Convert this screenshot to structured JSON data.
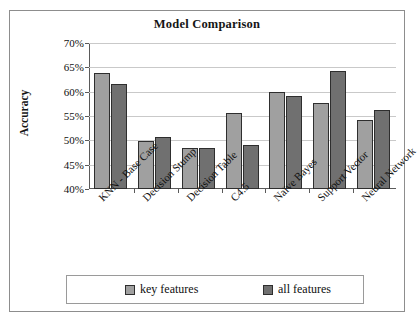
{
  "chart_data": {
    "type": "bar",
    "title": "Model Comparison",
    "xlabel": "",
    "ylabel": "Accuracy",
    "ylim": [
      40,
      70
    ],
    "ytick_labels": [
      "70%",
      "65%",
      "60%",
      "55%",
      "50%",
      "45%",
      "40%"
    ],
    "ytick_values": [
      70,
      65,
      60,
      55,
      50,
      45,
      40
    ],
    "grid": true,
    "legend_position": "bottom",
    "categories": [
      "KNN - Base Case",
      "Decision Stump",
      "Decision Table",
      "C4.5",
      "Naïve Bayes",
      "Support Vector",
      "Neural Network"
    ],
    "series": [
      {
        "name": "key features",
        "color": "#a0a0a0",
        "values": [
          63.8,
          49.9,
          48.4,
          55.6,
          60.0,
          57.7,
          54.1
        ]
      },
      {
        "name": "all features",
        "color": "#707070",
        "values": [
          61.5,
          50.6,
          48.4,
          49.1,
          59.2,
          64.2,
          56.2
        ]
      }
    ]
  },
  "legend": {
    "entries": [
      {
        "label": "key features",
        "color": "#a0a0a0"
      },
      {
        "label": "all features",
        "color": "#707070"
      }
    ]
  }
}
